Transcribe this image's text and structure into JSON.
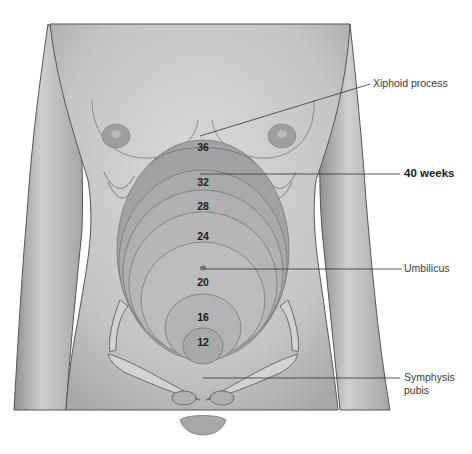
{
  "figure": {
    "colors": {
      "skin": "#c9c9c9",
      "skin_dark": "#9a9a9a",
      "uterus": "#b5b5b5",
      "outline": "#555555",
      "leader_line": "#333333",
      "background": "#ffffff"
    }
  },
  "labels": {
    "xiphoid": "Xiphoid process",
    "forty_weeks": "40 weeks",
    "umbilicus": "Umbilicus",
    "symphysis_line1": "Symphysis",
    "symphysis_line2": "pubis"
  },
  "weeks": [
    {
      "label": "36",
      "x": 203,
      "y": 148
    },
    {
      "label": "32",
      "x": 203,
      "y": 183
    },
    {
      "label": "28",
      "x": 203,
      "y": 207
    },
    {
      "label": "24",
      "x": 203,
      "y": 237
    },
    {
      "label": "20",
      "x": 203,
      "y": 283
    },
    {
      "label": "16",
      "x": 203,
      "y": 318
    },
    {
      "label": "12",
      "x": 203,
      "y": 343
    }
  ]
}
